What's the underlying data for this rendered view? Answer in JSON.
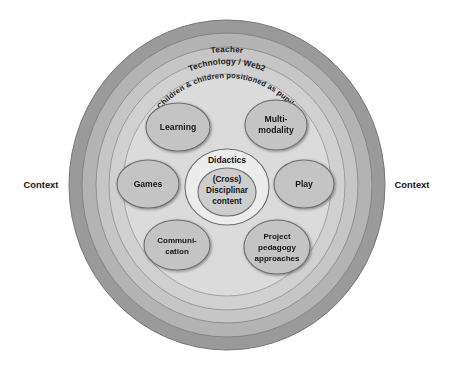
{
  "diagram": {
    "title_visible": false,
    "rings": [
      {
        "id": "context-ring",
        "label": "",
        "fill": "#9a9a9a",
        "stroke": "#7d7d7d"
      },
      {
        "id": "teacher-ring",
        "label": "Teacher",
        "fill": "#b4b4b4",
        "stroke": "#8a8a8a"
      },
      {
        "id": "technology-ring",
        "label": "Technology / Web2",
        "fill": "#c8c8c8",
        "stroke": "#949494"
      },
      {
        "id": "children-ring",
        "label": "Children & children positioned as pupils",
        "fill": "#d2d2d2",
        "stroke": "#9c9c9c"
      },
      {
        "id": "inner-field",
        "label": "",
        "fill": "#dcdcdc",
        "stroke": "#a5a5a5"
      }
    ],
    "context_labels": {
      "left": "Context",
      "right": "Context"
    },
    "center": {
      "outer_label": "Didactics",
      "core_lines": [
        "(Cross)",
        "Disciplinar",
        "content"
      ],
      "outer_fill": "#ececec",
      "core_fill": "#cdcdcd",
      "stroke": "#6f6f6f"
    },
    "nodes": [
      {
        "id": "learning",
        "lines": [
          "Learning"
        ],
        "fill": "#c4c4c4",
        "stroke": "#6f6f6f"
      },
      {
        "id": "multimodality",
        "lines": [
          "Multi-",
          "modality"
        ],
        "fill": "#c4c4c4",
        "stroke": "#6f6f6f"
      },
      {
        "id": "games",
        "lines": [
          "Games"
        ],
        "fill": "#c4c4c4",
        "stroke": "#6f6f6f"
      },
      {
        "id": "play",
        "lines": [
          "Play"
        ],
        "fill": "#c4c4c4",
        "stroke": "#6f6f6f"
      },
      {
        "id": "communication",
        "lines": [
          "Communi-",
          "cation"
        ],
        "fill": "#c4c4c4",
        "stroke": "#6f6f6f"
      },
      {
        "id": "projectped",
        "lines": [
          "Project",
          "pedagogy",
          "approaches"
        ],
        "fill": "#c4c4c4",
        "stroke": "#6f6f6f"
      }
    ]
  }
}
